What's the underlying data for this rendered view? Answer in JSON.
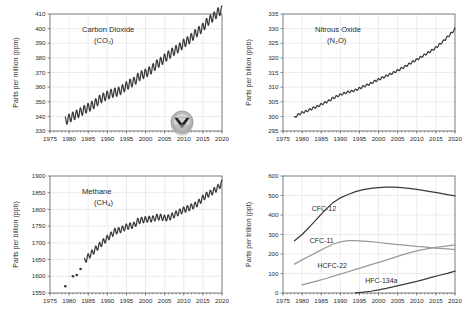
{
  "figure": {
    "logo": {
      "name": "noaa-logo",
      "description": "NOAA circular seal"
    }
  },
  "chart_data": [
    {
      "id": "co2",
      "type": "line",
      "title": "Carbon Dioxide",
      "subtitle": "(CO₂)",
      "xlabel": "",
      "ylabel": "Parts per million (ppm)",
      "xlim": [
        1975,
        2020
      ],
      "ylim": [
        330,
        410
      ],
      "xticks": [
        1975,
        1980,
        1985,
        1990,
        1995,
        2000,
        2005,
        2010,
        2015,
        2020
      ],
      "yticks": [
        330,
        340,
        350,
        360,
        370,
        380,
        390,
        400,
        410
      ],
      "grid": true,
      "legend": "none",
      "seasonal_amplitude": 3.0,
      "x": [
        1979,
        1980,
        1981,
        1982,
        1983,
        1984,
        1985,
        1986,
        1987,
        1988,
        1989,
        1990,
        1991,
        1992,
        1993,
        1994,
        1995,
        1996,
        1997,
        1998,
        1999,
        2000,
        2001,
        2002,
        2003,
        2004,
        2005,
        2006,
        2007,
        2008,
        2009,
        2010,
        2011,
        2012,
        2013,
        2014,
        2015,
        2016,
        2017,
        2018,
        2019,
        2020
      ],
      "values": [
        336.8,
        338.7,
        340.1,
        341.4,
        343.0,
        344.6,
        346.0,
        347.4,
        349.2,
        351.6,
        353.1,
        354.4,
        355.6,
        356.4,
        357.1,
        358.8,
        360.8,
        362.6,
        363.8,
        366.6,
        368.3,
        369.5,
        371.0,
        373.2,
        375.8,
        377.5,
        379.8,
        381.9,
        383.8,
        385.6,
        387.4,
        389.9,
        391.6,
        393.8,
        396.5,
        398.6,
        400.8,
        404.2,
        406.5,
        408.5,
        411.4,
        412.5
      ]
    },
    {
      "id": "n2o",
      "type": "line",
      "title": "Nitrous Oxide",
      "subtitle": "(N₂O)",
      "xlabel": "",
      "ylabel": "Parts per billion (ppb)",
      "xlim": [
        1975,
        2020
      ],
      "ylim": [
        295,
        335
      ],
      "xticks": [
        1975,
        1980,
        1985,
        1990,
        1995,
        2000,
        2005,
        2010,
        2015,
        2020
      ],
      "yticks": [
        295,
        300,
        305,
        310,
        315,
        320,
        325,
        330,
        335
      ],
      "grid": true,
      "legend": "none",
      "seasonal_amplitude": 0.35,
      "x": [
        1978,
        1979,
        1980,
        1981,
        1982,
        1983,
        1984,
        1985,
        1986,
        1987,
        1988,
        1989,
        1990,
        1991,
        1992,
        1993,
        1994,
        1995,
        1996,
        1997,
        1998,
        1999,
        2000,
        2001,
        2002,
        2003,
        2004,
        2005,
        2006,
        2007,
        2008,
        2009,
        2010,
        2011,
        2012,
        2013,
        2014,
        2015,
        2016,
        2017,
        2018,
        2019,
        2020
      ],
      "values": [
        299.6,
        300.6,
        301.3,
        301.7,
        302.3,
        302.9,
        303.4,
        304.1,
        304.7,
        305.3,
        306.2,
        306.8,
        307.4,
        307.9,
        308.3,
        308.6,
        309.0,
        309.6,
        310.2,
        310.7,
        311.3,
        312.0,
        312.6,
        313.2,
        313.8,
        314.4,
        315.0,
        315.7,
        316.4,
        317.1,
        317.9,
        318.7,
        319.4,
        320.2,
        321.0,
        321.8,
        322.6,
        323.5,
        324.6,
        325.8,
        327.1,
        328.4,
        329.8
      ]
    },
    {
      "id": "ch4",
      "type": "line",
      "title": "Methane",
      "subtitle": "(CH₄)",
      "xlabel": "",
      "ylabel": "Parts per billion (ppb)",
      "xlim": [
        1975,
        2020
      ],
      "ylim": [
        1550,
        1900
      ],
      "xticks": [
        1975,
        1980,
        1985,
        1990,
        1995,
        2000,
        2005,
        2010,
        2015,
        2020
      ],
      "yticks": [
        1550,
        1600,
        1650,
        1700,
        1750,
        1800,
        1850,
        1900
      ],
      "grid": true,
      "legend": "none",
      "seasonal_amplitude": 9.0,
      "early_points_x": [
        1979,
        1981,
        1982,
        1983
      ],
      "early_points_y": [
        1570,
        1600,
        1604,
        1622
      ],
      "x": [
        1984,
        1985,
        1986,
        1987,
        1988,
        1989,
        1990,
        1991,
        1992,
        1993,
        1994,
        1995,
        1996,
        1997,
        1998,
        1999,
        2000,
        2001,
        2002,
        2003,
        2004,
        2005,
        2006,
        2007,
        2008,
        2009,
        2010,
        2011,
        2012,
        2013,
        2014,
        2015,
        2016,
        2017,
        2018,
        2019,
        2020
      ],
      "values": [
        1645,
        1659,
        1670,
        1682,
        1693,
        1704,
        1714,
        1724,
        1735,
        1737,
        1742,
        1748,
        1751,
        1753,
        1765,
        1768,
        1770,
        1771,
        1772,
        1777,
        1777,
        1774,
        1775,
        1781,
        1787,
        1793,
        1799,
        1803,
        1808,
        1813,
        1822,
        1834,
        1843,
        1849,
        1857,
        1866,
        1879
      ]
    },
    {
      "id": "halocarbons",
      "type": "line",
      "title": "",
      "subtitle": "",
      "xlabel": "",
      "ylabel": "Parts per trillion (ppt)",
      "xlim": [
        1975,
        2020
      ],
      "ylim": [
        0,
        600
      ],
      "xticks": [
        1975,
        1980,
        1985,
        1990,
        1995,
        2000,
        2005,
        2010,
        2015,
        2020
      ],
      "yticks": [
        0,
        100,
        200,
        300,
        400,
        500,
        600
      ],
      "grid": true,
      "legend": "inline-labels",
      "series": [
        {
          "name": "CFC-12",
          "shade": "dark",
          "label_x": 1982.5,
          "label_y": 420,
          "x": [
            1978,
            1980,
            1982,
            1984,
            1986,
            1988,
            1990,
            1992,
            1994,
            1996,
            1998,
            2000,
            2002,
            2004,
            2006,
            2008,
            2010,
            2012,
            2014,
            2016,
            2018,
            2020
          ],
          "values": [
            268,
            300,
            340,
            383,
            425,
            462,
            488,
            505,
            520,
            530,
            537,
            541,
            543,
            543,
            541,
            537,
            531,
            525,
            519,
            512,
            505,
            498
          ]
        },
        {
          "name": "CFC-11",
          "shade": "light",
          "label_x": 1982,
          "label_y": 255,
          "x": [
            1978,
            1980,
            1982,
            1984,
            1986,
            1988,
            1990,
            1992,
            1994,
            1996,
            1998,
            2000,
            2002,
            2004,
            2006,
            2008,
            2010,
            2012,
            2014,
            2016,
            2018,
            2020
          ],
          "values": [
            148,
            170,
            190,
            211,
            231,
            250,
            262,
            268,
            269,
            266,
            263,
            259,
            255,
            251,
            247,
            243,
            239,
            236,
            232,
            229,
            226,
            223
          ]
        },
        {
          "name": "HCFC-22",
          "shade": "light",
          "label_x": 1984,
          "label_y": 130,
          "x": [
            1980,
            1982,
            1984,
            1986,
            1988,
            1990,
            1992,
            1994,
            1996,
            1998,
            2000,
            2002,
            2004,
            2006,
            2008,
            2010,
            2012,
            2014,
            2016,
            2018,
            2020
          ],
          "values": [
            42,
            52,
            62,
            73,
            85,
            97,
            109,
            121,
            133,
            145,
            157,
            169,
            181,
            194,
            206,
            216,
            224,
            231,
            237,
            242,
            247
          ]
        },
        {
          "name": "HFC-134a",
          "shade": "dark",
          "label_x": 1996.5,
          "label_y": 52,
          "x": [
            1994,
            1996,
            1998,
            2000,
            2002,
            2004,
            2006,
            2008,
            2010,
            2012,
            2014,
            2016,
            2018,
            2020
          ],
          "values": [
            1,
            4,
            9,
            16,
            24,
            33,
            42,
            51,
            60,
            70,
            81,
            91,
            101,
            112
          ]
        }
      ]
    }
  ]
}
